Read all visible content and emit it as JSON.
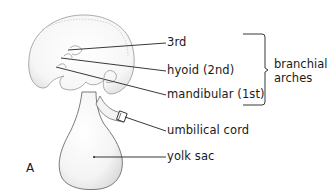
{
  "figure": {
    "panel_letter": "A",
    "labels": {
      "third": "3rd",
      "hyoid": "hyoid (2nd)",
      "mandibular": "mandibular (1st)",
      "umbilical_cord": "umbilical cord",
      "yolk_sac": "yolk sac"
    },
    "bracket_group": {
      "line1": "branchial",
      "line2": "arches"
    }
  }
}
